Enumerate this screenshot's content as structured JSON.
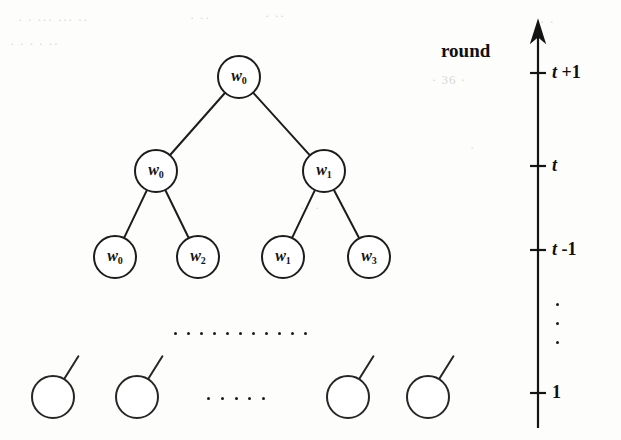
{
  "figure": {
    "background_color": "#fdfdfc",
    "ink_color": "#1a1a1a"
  },
  "axis": {
    "name": "round-axis",
    "caption": "round",
    "direction": "up",
    "ticks": [
      {
        "id": "tick-t-plus-1",
        "label": "t +1",
        "base": "t",
        "offset": "+1",
        "y": 73
      },
      {
        "id": "tick-t",
        "label": "t",
        "base": "t",
        "offset": "",
        "y": 166
      },
      {
        "id": "tick-t-minus-1",
        "label": "t -1",
        "base": "t",
        "offset": "-1",
        "y": 250
      },
      {
        "id": "tick-1",
        "label": "1",
        "base": "1",
        "offset": "",
        "y": 393
      }
    ],
    "vertical_ellipsis": "⋮",
    "ellipsis_dot_count": 3
  },
  "tree": {
    "levels": [
      {
        "level_name": "level-t-plus-1",
        "round": "t +1",
        "nodes": [
          {
            "id": "node-root",
            "label": "w",
            "subscript": "0",
            "cx": 239,
            "cy": 77
          }
        ]
      },
      {
        "level_name": "level-t",
        "round": "t",
        "nodes": [
          {
            "id": "node-t-left",
            "label": "w",
            "subscript": "0",
            "cx": 156,
            "cy": 171
          },
          {
            "id": "node-t-right",
            "label": "w",
            "subscript": "1",
            "cx": 324,
            "cy": 171
          }
        ]
      },
      {
        "level_name": "level-t-minus-1",
        "round": "t -1",
        "nodes": [
          {
            "id": "node-leaf-0",
            "label": "w",
            "subscript": "0",
            "cx": 115,
            "cy": 257
          },
          {
            "id": "node-leaf-2",
            "label": "w",
            "subscript": "2",
            "cx": 198,
            "cy": 257
          },
          {
            "id": "node-leaf-1",
            "label": "w",
            "subscript": "1",
            "cx": 283,
            "cy": 257
          },
          {
            "id": "node-leaf-3",
            "label": "w",
            "subscript": "3",
            "cx": 369,
            "cy": 257
          }
        ]
      }
    ],
    "edges": [
      {
        "from": "node-root",
        "to": "node-t-left"
      },
      {
        "from": "node-root",
        "to": "node-t-right"
      },
      {
        "from": "node-t-left",
        "to": "node-leaf-0"
      },
      {
        "from": "node-t-left",
        "to": "node-leaf-2"
      },
      {
        "from": "node-t-right",
        "to": "node-leaf-1"
      },
      {
        "from": "node-t-right",
        "to": "node-leaf-3"
      }
    ],
    "middle_ellipsis": {
      "name": "tree-vertical-gap-ellipsis",
      "dot_count": 11,
      "y": 332,
      "x_start": 174,
      "x_end": 304
    },
    "bottom_level": {
      "level_name": "level-1",
      "round": "1",
      "nodes": [
        {
          "id": "bottom-node-1",
          "cx": 53,
          "cy": 397
        },
        {
          "id": "bottom-node-2",
          "cx": 137,
          "cy": 397
        },
        {
          "id": "bottom-node-3",
          "cx": 348,
          "cy": 397
        },
        {
          "id": "bottom-node-4",
          "cx": 428,
          "cy": 397
        }
      ],
      "ellipsis": {
        "name": "bottom-row-ellipsis",
        "dot_count": 5,
        "y": 397,
        "x_start": 207,
        "x_end": 262
      }
    }
  },
  "ghost_marks": [
    {
      "text": "·  ·    ···  ···     ··",
      "x": 18,
      "y": 12
    },
    {
      "text": "·   ·    ·  ·      ·· ",
      "x": 10,
      "y": 36
    },
    {
      "text": "· ··",
      "x": 190,
      "y": 10
    },
    {
      "text": "·  ··",
      "x": 265,
      "y": 8
    },
    {
      "text": "· 36 ·",
      "x": 432,
      "y": 72
    },
    {
      "text": "· ·",
      "x": 540,
      "y": 14
    },
    {
      "text": "·· ·",
      "x": 300,
      "y": 200
    },
    {
      "text": "·",
      "x": 470,
      "y": 140
    }
  ]
}
